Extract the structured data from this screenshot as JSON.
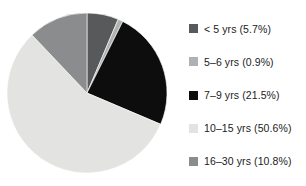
{
  "chart_data": {
    "type": "pie",
    "title": "",
    "subtitle": "",
    "xlabel": "",
    "ylabel": "",
    "legend_position": "right",
    "grid": false,
    "start_angle_deg": 0,
    "direction": "clockwise",
    "categories": [
      "< 5 yrs",
      "5–6 yrs",
      "7–9 yrs",
      "10–15 yrs",
      "16–30 yrs"
    ],
    "values": [
      5.7,
      0.9,
      21.5,
      50.6,
      10.8
    ],
    "value_unit": "%",
    "colors": [
      "#58595b",
      "#b0b1b3",
      "#0d0d0d",
      "#e3e3e1",
      "#8b8c8e"
    ],
    "slices": [
      {
        "label": "< 5 yrs",
        "value": 5.7,
        "display": "< 5 yrs (5.7%)",
        "color": "#58595b"
      },
      {
        "label": "5–6 yrs",
        "value": 0.9,
        "display": "5–6 yrs (0.9%)",
        "color": "#b0b1b3"
      },
      {
        "label": "7–9 yrs",
        "value": 21.5,
        "display": "7–9 yrs (21.5%)",
        "color": "#0d0d0d"
      },
      {
        "label": "10–15 yrs",
        "value": 50.6,
        "display": "10–15 yrs (50.6%)",
        "color": "#e3e3e1"
      },
      {
        "label": "16–30 yrs",
        "value": 10.8,
        "display": "16–30 yrs (10.8%)",
        "color": "#8b8c8e"
      }
    ]
  },
  "legend": {
    "items": [
      {
        "label": "< 5 yrs (5.7%)",
        "color": "#58595b"
      },
      {
        "label": "5–6 yrs (0.9%)",
        "color": "#b0b1b3"
      },
      {
        "label": "7–9 yrs (21.5%)",
        "color": "#0d0d0d"
      },
      {
        "label": "10–15 yrs (50.6%)",
        "color": "#e3e3e1"
      },
      {
        "label": "16–30 yrs (10.8%)",
        "color": "#8b8c8e"
      }
    ]
  }
}
